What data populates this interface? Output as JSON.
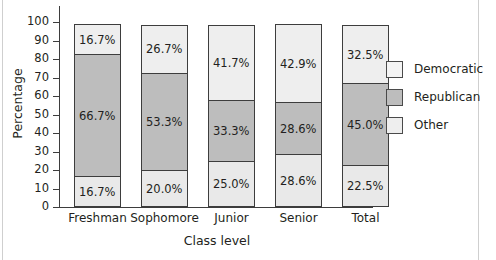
{
  "chart_data": {
    "type": "bar",
    "subtype": "stacked-bar-100-percent",
    "title": "",
    "xlabel": "Class level",
    "ylabel": "Percentage",
    "categories": [
      "Freshman",
      "Sophomore",
      "Junior",
      "Senior",
      "Total"
    ],
    "ylim": [
      0,
      100
    ],
    "yticks": [
      0,
      10,
      20,
      30,
      40,
      50,
      60,
      70,
      80,
      90,
      100
    ],
    "ytick_labels": [
      "0",
      "10",
      "20",
      "30",
      "40",
      "50",
      "60",
      "70",
      "80",
      "90",
      "100"
    ],
    "grid": false,
    "legend_position": "right",
    "stack_order_bottom_to_top": [
      "Democratic",
      "Republican",
      "Other"
    ],
    "series": [
      {
        "name": "Democratic",
        "color": "#e9e9e9",
        "values": [
          16.7,
          20.0,
          25.0,
          28.6,
          22.5
        ],
        "labels": [
          "16.7%",
          "20.0%",
          "25.0%",
          "28.6%",
          "22.5%"
        ]
      },
      {
        "name": "Republican",
        "color": "#bdbdbd",
        "values": [
          66.7,
          53.3,
          33.3,
          28.6,
          45.0
        ],
        "labels": [
          "66.7%",
          "53.3%",
          "33.3%",
          "28.6%",
          "45.0%"
        ]
      },
      {
        "name": "Other",
        "color": "#eeeeee",
        "values": [
          16.7,
          26.7,
          41.7,
          42.9,
          32.5
        ],
        "labels": [
          "16.7%",
          "26.7%",
          "41.7%",
          "42.9%",
          "32.5%"
        ]
      }
    ]
  },
  "legend": {
    "items": [
      {
        "label": "Democratic",
        "color": "#f4f4f4"
      },
      {
        "label": "Republican",
        "color": "#bdbdbd"
      },
      {
        "label": "Other",
        "color": "#eeeeee"
      }
    ]
  },
  "colors": {
    "axis": "#3d3d3d",
    "text": "#231f20",
    "background": "#ffffff",
    "democratic": "#f0f0f0",
    "republican": "#bdbdbd",
    "other": "#ededed"
  }
}
